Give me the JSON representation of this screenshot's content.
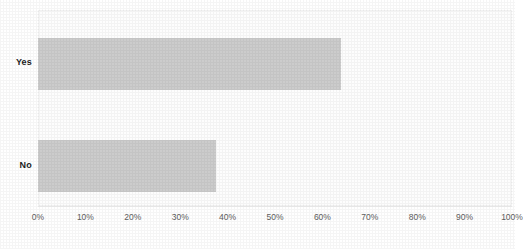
{
  "chart_data": {
    "type": "bar",
    "orientation": "horizontal",
    "title": "",
    "xlabel": "",
    "ylabel": "",
    "categories": [
      "Yes",
      "No"
    ],
    "values": [
      64,
      37.5
    ],
    "value_unit": "%",
    "xlim": [
      0,
      100
    ],
    "xticks": [
      0,
      10,
      20,
      30,
      40,
      50,
      60,
      70,
      80,
      90,
      100
    ],
    "xtick_labels": [
      "0%",
      "10%",
      "20%",
      "30%",
      "40%",
      "50%",
      "60%",
      "70%",
      "80%",
      "90%",
      "100%"
    ],
    "grid": false,
    "legend": false,
    "series": [
      {
        "name": "",
        "values": [
          64,
          37.5
        ],
        "color": "#cccccc"
      }
    ]
  },
  "style": {
    "bar_color": "#cccccc",
    "background_color": "#ffffff",
    "plot_background_color": "#fdfdfd",
    "frame_color": "#f2f2f2",
    "axis_color": "#f0f0f0",
    "category_label_color": "#1d1d1d",
    "tick_label_color": "#5e5e5e"
  }
}
